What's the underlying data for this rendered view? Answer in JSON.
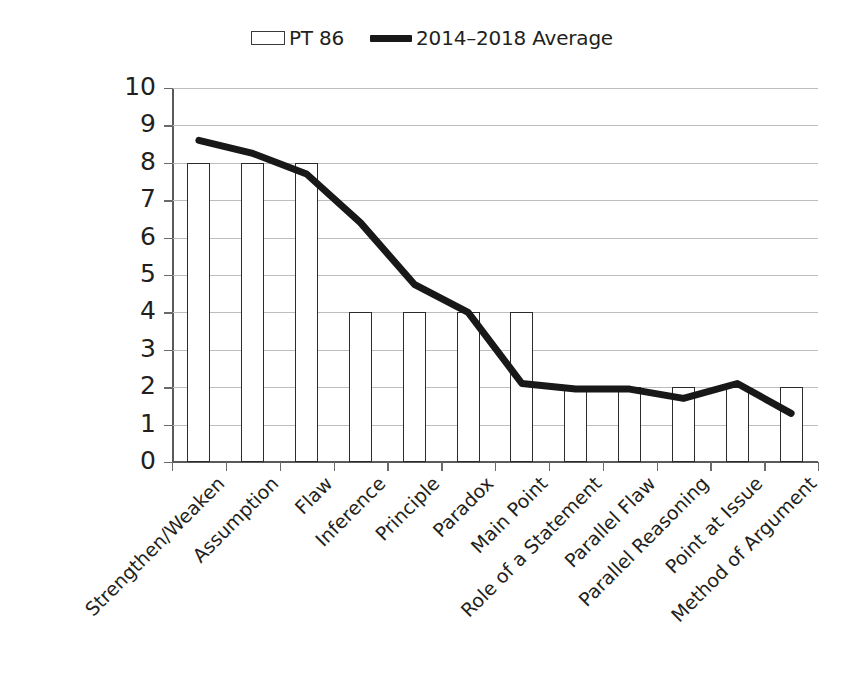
{
  "legend": {
    "position": "top-center",
    "entries": [
      {
        "label": "PT 86",
        "marker": "hollow-bar-swatch",
        "color": "#ffffff",
        "border": "#3a3a3a"
      },
      {
        "label": "2014–2018 Average",
        "marker": "thick-line-swatch",
        "color": "#181818"
      }
    ]
  },
  "axes": {
    "y_ticks": [
      "10",
      "9",
      "8",
      "7",
      "6",
      "5",
      "4",
      "3",
      "2",
      "1",
      "0"
    ]
  },
  "chart_data": {
    "type": "bar",
    "title": "",
    "subtitle": "",
    "xlabel": "",
    "ylabel": "",
    "ylim": [
      0,
      10
    ],
    "ytick_step": 1,
    "grid": true,
    "legend_position": "top-center",
    "categories": [
      "Strengthen/Weaken",
      "Assumption",
      "Flaw",
      "Inference",
      "Principle",
      "Paradox",
      "Main Point",
      "Role of a Statement",
      "Parallel Flaw",
      "Parallel Reasoning",
      "Point at Issue",
      "Method of Argument"
    ],
    "series": [
      {
        "name": "PT 86",
        "type": "bar",
        "color": "#ffffff",
        "border_color": "#2b2b2b",
        "values": [
          8,
          8,
          8,
          4,
          4,
          4,
          4,
          2,
          2,
          2,
          2,
          2
        ]
      },
      {
        "name": "2014–2018 Average",
        "type": "line",
        "color": "#181818",
        "line_width": 7,
        "values": [
          8.6,
          8.25,
          7.7,
          6.4,
          4.75,
          4.0,
          2.1,
          1.95,
          1.95,
          1.7,
          2.1,
          1.3
        ]
      }
    ]
  }
}
